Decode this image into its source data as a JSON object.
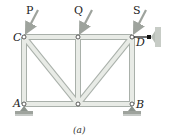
{
  "figure": {
    "caption": "(a)",
    "loads": [
      {
        "label": "P",
        "at_joint": "C"
      },
      {
        "label": "Q",
        "at_joint": "top-middle"
      },
      {
        "label": "S",
        "at_joint": "D"
      }
    ],
    "joints": [
      {
        "label": "A"
      },
      {
        "label": "B"
      },
      {
        "label": "C"
      },
      {
        "label": "D"
      }
    ],
    "colors": {
      "member_fill": "#e8ebe6",
      "member_edge": "#a9b0aa",
      "load_arrow": "#9ea39d",
      "support": "#8d948e",
      "wall": "#c7ccc6",
      "link": "#111111"
    }
  }
}
